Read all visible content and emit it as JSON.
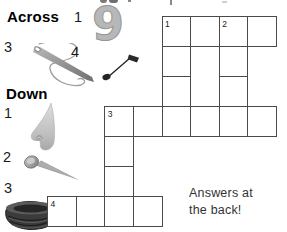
{
  "page": {
    "answers_note": "Answers at\nthe back!"
  },
  "sections": {
    "across": {
      "title": "Across",
      "clues": [
        {
          "number": "1",
          "image": "nine"
        },
        {
          "number": "3",
          "image": "needle-and-thread"
        },
        {
          "number": "4",
          "image": "musical-note"
        }
      ]
    },
    "down": {
      "title": "Down",
      "clues": [
        {
          "number": "1",
          "image": "nose"
        },
        {
          "number": "2",
          "image": "nail"
        },
        {
          "number": "3",
          "image": "nest"
        }
      ]
    }
  },
  "images": {
    "nine_glyph": "9"
  },
  "grid": {
    "origin_x": 47.6,
    "origin_y": 16,
    "cell_w": 28.6,
    "cell_h": 30,
    "line_color": "#4a4a4a",
    "cells": [
      {
        "col": 4,
        "row": 0,
        "label": "1"
      },
      {
        "col": 5,
        "row": 0
      },
      {
        "col": 6,
        "row": 0,
        "label": "2"
      },
      {
        "col": 7,
        "row": 0
      },
      {
        "col": 4,
        "row": 1
      },
      {
        "col": 6,
        "row": 1
      },
      {
        "col": 4,
        "row": 2
      },
      {
        "col": 6,
        "row": 2
      },
      {
        "col": 2,
        "row": 3,
        "label": "3"
      },
      {
        "col": 3,
        "row": 3
      },
      {
        "col": 4,
        "row": 3
      },
      {
        "col": 5,
        "row": 3
      },
      {
        "col": 6,
        "row": 3
      },
      {
        "col": 7,
        "row": 3
      },
      {
        "col": 2,
        "row": 4
      },
      {
        "col": 2,
        "row": 5
      },
      {
        "col": 0,
        "row": 6,
        "label": "4"
      },
      {
        "col": 1,
        "row": 6
      },
      {
        "col": 2,
        "row": 6
      },
      {
        "col": 3,
        "row": 6
      }
    ]
  },
  "colors": {
    "grid_line": "#4a4a4a",
    "heading_ink": "#000000",
    "body_ink": "#333333",
    "nine_gray": "#b7b7b7"
  }
}
